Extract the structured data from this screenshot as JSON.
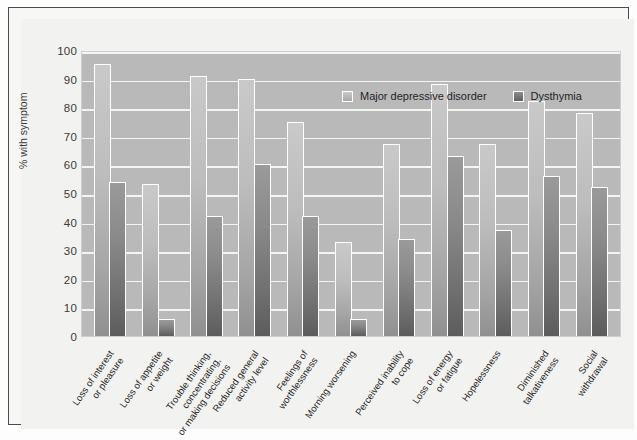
{
  "chart_data": {
    "type": "bar",
    "title": "",
    "xlabel": "",
    "ylabel": "% with symptom",
    "ylim": [
      0,
      100
    ],
    "ytick_step": 10,
    "yticks": [
      100,
      90,
      80,
      70,
      60,
      50,
      40,
      30,
      20,
      10,
      0
    ],
    "grid": true,
    "legend_position": "top-right inside plot",
    "categories": [
      "Loss of interest\nor pleasure",
      "Loss of appetite\nor weight",
      "Trouble thinking,\nconcentrating,\nor making decisions",
      "Reduced general\nactivity level",
      "Feelings of\nworthlessness",
      "Morning worsening",
      "Perceived inability\nto cope",
      "Loss of energy\nor fatigue",
      "Hopelessness",
      "Diminished\ntalkativeness",
      "Social\nwithdrawal"
    ],
    "series": [
      {
        "name": "Major depressive disorder",
        "color": "#bdbdbd",
        "values": [
          95,
          53,
          91,
          90,
          75,
          33,
          67,
          88,
          67,
          82,
          78
        ]
      },
      {
        "name": "Dysthymia",
        "color": "#6f6f6f",
        "values": [
          54,
          6,
          42,
          60,
          42,
          6,
          34,
          63,
          37,
          56,
          52
        ]
      }
    ]
  },
  "colors": {
    "plot_background": "#b9b9b9",
    "page_background": "#f2f2f0",
    "frame": "#4a4a4a",
    "gridline": "#f4f4f2",
    "bar_outline": "#ffffff",
    "text": "#1f1f1f"
  }
}
